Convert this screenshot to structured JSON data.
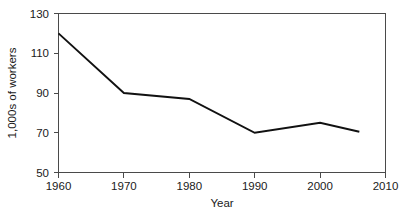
{
  "chart_data": {
    "type": "line",
    "title": "",
    "xlabel": "Year",
    "ylabel": "1,000s of workers",
    "x": [
      1960,
      1970,
      1980,
      1990,
      2000,
      2006
    ],
    "values": [
      120,
      90,
      87,
      70,
      75,
      70.5
    ],
    "series": [
      {
        "name": "workers",
        "values": [
          120,
          90,
          87,
          70,
          75,
          70.5
        ]
      }
    ],
    "xlim": [
      1960,
      2010
    ],
    "ylim": [
      50,
      130
    ],
    "xticks": [
      1960,
      1970,
      1980,
      1990,
      2000,
      2010
    ],
    "xtick_labels": [
      "1960",
      "1970",
      "1980",
      "1990",
      "2000",
      "2010"
    ],
    "yticks": [
      50,
      70,
      90,
      110,
      130
    ],
    "ytick_labels": [
      "50",
      "70",
      "90",
      "110",
      "130"
    ],
    "grid": false,
    "legend": false,
    "legend_position": "none",
    "line_color": "#111111",
    "axis_color": "#4a4a4a",
    "background_color": "#ffffff"
  },
  "axes": {
    "x_title": "Year",
    "y_title": "1,000s of workers",
    "y_labels": {
      "t0": "50",
      "t1": "70",
      "t2": "90",
      "t3": "110",
      "t4": "130"
    },
    "x_labels": {
      "t0": "1960",
      "t1": "1970",
      "t2": "1980",
      "t3": "1990",
      "t4": "2000",
      "t5": "2010"
    }
  }
}
